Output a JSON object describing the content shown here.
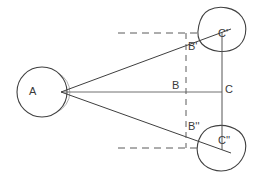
{
  "figure": {
    "type": "geometry-diagram",
    "background_color": "#ffffff",
    "stroke_color": "#404040",
    "dash_color": "#555555",
    "faint_stroke_color": "#9a9a9a",
    "label_color": "#3a3a3a"
  },
  "labels": [
    {
      "id": "A",
      "text": "A",
      "x": 29,
      "y": 87
    },
    {
      "id": "B",
      "text": "B",
      "x": 172,
      "y": 81
    },
    {
      "id": "C",
      "text": "C",
      "x": 225,
      "y": 84
    },
    {
      "id": "Bprime",
      "text": "B'",
      "x": 187,
      "y": 42
    },
    {
      "id": "Cprime",
      "text": "C'",
      "x": 218,
      "y": 30
    },
    {
      "id": "Bdouble",
      "text": "B''",
      "x": 187,
      "y": 122
    },
    {
      "id": "Cdouble",
      "text": "C''",
      "x": 218,
      "y": 136
    }
  ],
  "circles": [
    {
      "id": "circle-A",
      "cx": 42,
      "cy": 92,
      "r": 25
    },
    {
      "id": "circle-C-prime",
      "cx": 221,
      "cy": 30,
      "r": 23
    },
    {
      "id": "circle-C-double",
      "cx": 221,
      "cy": 148,
      "r": 23
    }
  ],
  "points": {
    "apex": {
      "x": 61,
      "y": 92
    },
    "B": {
      "x": 186,
      "y": 92
    },
    "C": {
      "x": 222,
      "y": 92
    },
    "Bprime": {
      "x": 186,
      "y": 47
    },
    "Cprime": {
      "x": 222,
      "y": 33
    },
    "Bdouble": {
      "x": 186,
      "y": 134
    },
    "Cdouble": {
      "x": 222,
      "y": 148
    }
  },
  "lines": {
    "axis_A_to_C": {
      "x1": 61,
      "y1": 92,
      "x2": 222,
      "y2": 92,
      "style": "solid"
    },
    "ray_A_to_Cprime": {
      "x1": 61,
      "y1": 92,
      "x2": 228,
      "y2": 30,
      "style": "solid"
    },
    "ray_A_to_Cdouble": {
      "x1": 61,
      "y1": 92,
      "x2": 228,
      "y2": 152,
      "style": "solid"
    },
    "vertical_C_axis": {
      "x1": 222,
      "y1": 33,
      "x2": 222,
      "y2": 149,
      "style": "solid"
    },
    "vertical_B_dashed": {
      "x1": 186,
      "y1": 33,
      "x2": 186,
      "y2": 148,
      "style": "dashed"
    },
    "top_dashed": {
      "x1": 118,
      "y1": 33,
      "x2": 197,
      "y2": 33,
      "style": "dashed"
    },
    "bottom_dashed": {
      "x1": 118,
      "y1": 148,
      "x2": 197,
      "y2": 148,
      "style": "dashed"
    }
  }
}
